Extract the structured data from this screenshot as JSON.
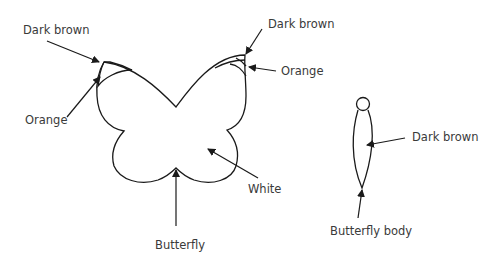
{
  "diagram": {
    "figures": [
      {
        "id": "butterfly",
        "caption": "Butterfly",
        "parts": [
          {
            "label": "Dark brown",
            "target": "left wing tip"
          },
          {
            "label": "Orange",
            "target": "left wing tip band"
          },
          {
            "label": "Dark brown",
            "target": "right wing tip"
          },
          {
            "label": "Orange",
            "target": "right wing tip band"
          },
          {
            "label": "White",
            "target": "wing body"
          }
        ]
      },
      {
        "id": "butterfly-body",
        "caption": "Butterfly body",
        "parts": [
          {
            "label": "Dark brown",
            "target": "body"
          }
        ]
      }
    ],
    "colors": {
      "line": "#1a1a1a",
      "text": "#3a3a3a",
      "background": "#ffffff"
    }
  }
}
